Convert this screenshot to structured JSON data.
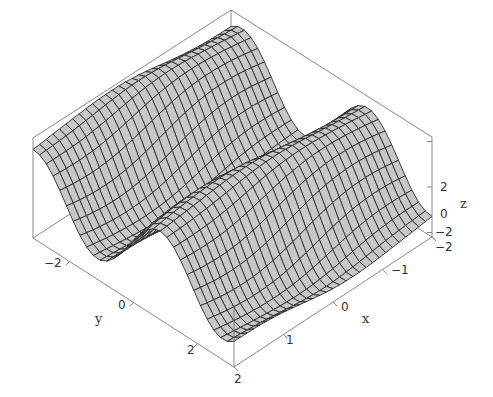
{
  "chart_data": {
    "type": "surface3d",
    "title": "",
    "function": "z = f(x, y), ridges parallel to x-axis, periodic in y",
    "xlabel": "x",
    "ylabel": "y",
    "zlabel": "z",
    "xlim": [
      -2,
      2
    ],
    "ylim": [
      -3.14,
      3.14
    ],
    "zlim": [
      -2.2,
      2.2
    ],
    "x_ticks": [
      {
        "value": -2,
        "label": "-2"
      },
      {
        "value": -1,
        "label": "−1"
      },
      {
        "value": 0,
        "label": "0"
      },
      {
        "value": 1,
        "label": "1"
      },
      {
        "value": 2,
        "label": "2"
      }
    ],
    "y_ticks": [
      {
        "value": -2,
        "label": "−2"
      },
      {
        "value": 0,
        "label": "0"
      },
      {
        "value": 2,
        "label": "2"
      }
    ],
    "z_ticks": [
      {
        "value": 2,
        "label": "2"
      },
      {
        "value": 0,
        "label": "0"
      },
      {
        "value": -2,
        "label": "−2"
      }
    ],
    "grid_x": 30,
    "grid_y": 30,
    "surface_color": "#c8c8c8",
    "mesh_color": "#2a2a2a",
    "box_color": "#6a6a6a",
    "box": true,
    "legend": null
  },
  "labels": {
    "x_axis": "x",
    "y_axis": "y",
    "z_axis": "z",
    "x_ticks": [
      "−2",
      "−1",
      "0",
      "1",
      "2"
    ],
    "y_ticks": [
      "−2",
      "0",
      "2"
    ],
    "z_ticks": [
      "2",
      "0",
      "−2"
    ]
  }
}
